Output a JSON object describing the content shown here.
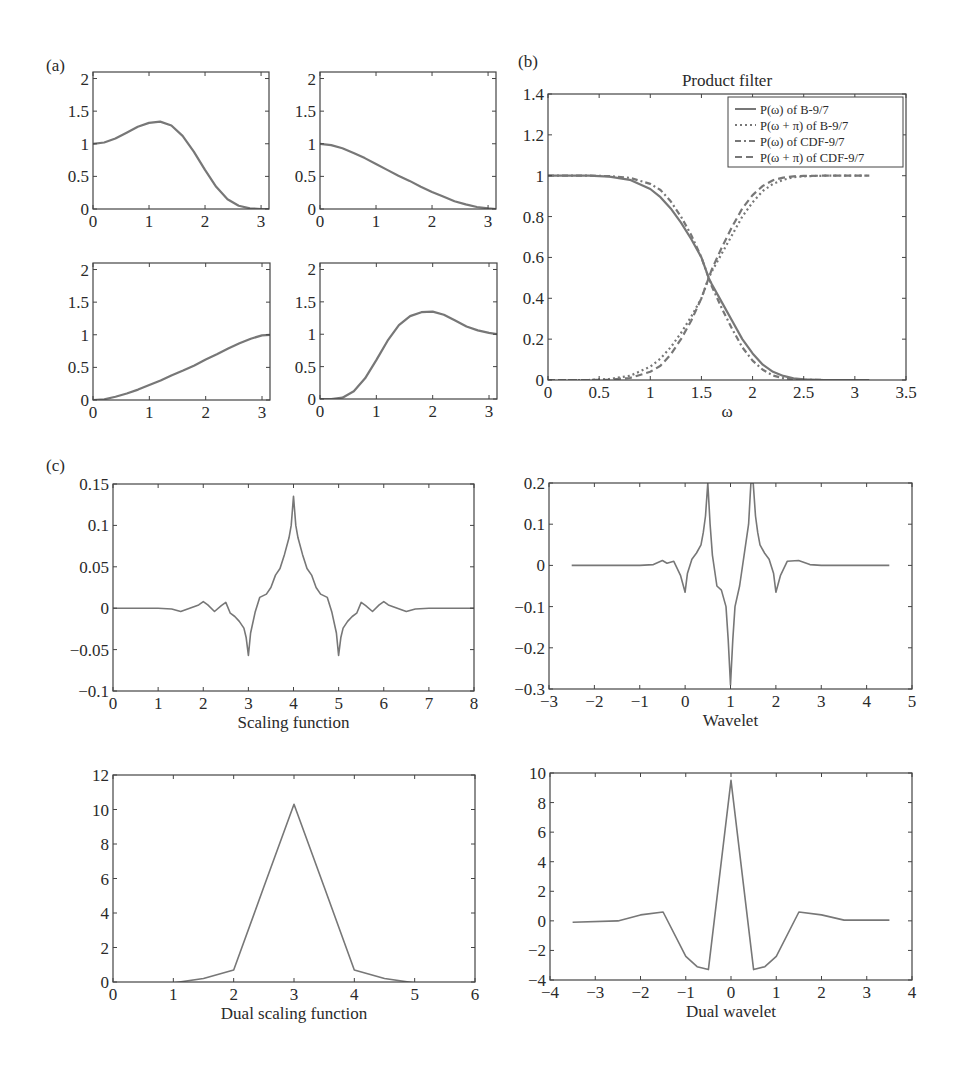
{
  "figure": {
    "panel_labels": [
      {
        "text": "(a)",
        "x": 46,
        "y": 56
      },
      {
        "text": "(b)",
        "x": 518,
        "y": 52
      },
      {
        "text": "(c)",
        "x": 46,
        "y": 456
      }
    ],
    "line_color": "#777777",
    "axis_color": "#444444"
  },
  "chart_data": [
    {
      "id": "a1",
      "type": "line",
      "panel": "(a)",
      "title": "",
      "xlabel": "",
      "ylabel": "",
      "box": [
        93,
        72,
        269,
        209
      ],
      "xlim": [
        0,
        3.1416
      ],
      "ylim": [
        0,
        2.1
      ],
      "xticks": [
        0,
        1,
        2,
        3
      ],
      "yticks": [
        0,
        0.5,
        1,
        1.5,
        2
      ],
      "xticklabels": [
        "0",
        "1",
        "2",
        "3"
      ],
      "yticklabels": [
        "0",
        "0.5",
        "1",
        "1.5",
        "2"
      ],
      "series": [
        {
          "name": "curve",
          "style": "solid",
          "x": [
            0,
            0.2,
            0.4,
            0.6,
            0.8,
            1.0,
            1.2,
            1.4,
            1.6,
            1.8,
            2.0,
            2.2,
            2.4,
            2.6,
            2.8,
            3.0,
            3.1416
          ],
          "y": [
            1.0,
            1.02,
            1.08,
            1.17,
            1.26,
            1.32,
            1.34,
            1.28,
            1.12,
            0.88,
            0.6,
            0.34,
            0.15,
            0.05,
            0.01,
            0.0,
            0.0
          ]
        }
      ]
    },
    {
      "id": "a2",
      "type": "line",
      "panel": "(a)",
      "title": "",
      "xlabel": "",
      "ylabel": "",
      "box": [
        320,
        72,
        496,
        209
      ],
      "xlim": [
        0,
        3.1416
      ],
      "ylim": [
        0,
        2.1
      ],
      "xticks": [
        0,
        1,
        2,
        3
      ],
      "yticks": [
        0,
        0.5,
        1,
        1.5,
        2
      ],
      "xticklabels": [
        "0",
        "1",
        "2",
        "3"
      ],
      "yticklabels": [
        "0",
        "0.5",
        "1",
        "1.5",
        "2"
      ],
      "series": [
        {
          "name": "curve",
          "style": "solid",
          "x": [
            0,
            0.2,
            0.4,
            0.6,
            0.8,
            1.0,
            1.2,
            1.4,
            1.6,
            1.8,
            2.0,
            2.2,
            2.4,
            2.6,
            2.8,
            3.0,
            3.1416
          ],
          "y": [
            1.0,
            0.98,
            0.93,
            0.86,
            0.78,
            0.69,
            0.6,
            0.51,
            0.43,
            0.34,
            0.26,
            0.19,
            0.12,
            0.07,
            0.03,
            0.01,
            0.0
          ]
        }
      ]
    },
    {
      "id": "a3",
      "type": "line",
      "panel": "(a)",
      "title": "",
      "xlabel": "",
      "ylabel": "",
      "box": [
        93,
        263,
        270,
        400
      ],
      "xlim": [
        0,
        3.1416
      ],
      "ylim": [
        0,
        2.1
      ],
      "xticks": [
        0,
        1,
        2,
        3
      ],
      "yticks": [
        0,
        0.5,
        1,
        1.5,
        2
      ],
      "xticklabels": [
        "0",
        "1",
        "2",
        "3"
      ],
      "yticklabels": [
        "0",
        "0.5",
        "1",
        "1.5",
        "2"
      ],
      "series": [
        {
          "name": "curve",
          "style": "solid",
          "x": [
            0,
            0.2,
            0.4,
            0.6,
            0.8,
            1.0,
            1.2,
            1.4,
            1.6,
            1.8,
            2.0,
            2.2,
            2.4,
            2.6,
            2.8,
            3.0,
            3.1416
          ],
          "y": [
            0.0,
            0.01,
            0.05,
            0.1,
            0.16,
            0.23,
            0.3,
            0.38,
            0.45,
            0.53,
            0.62,
            0.7,
            0.79,
            0.87,
            0.94,
            0.99,
            1.0
          ]
        }
      ]
    },
    {
      "id": "a4",
      "type": "line",
      "panel": "(a)",
      "title": "",
      "xlabel": "",
      "ylabel": "",
      "box": [
        320,
        263,
        497,
        399
      ],
      "xlim": [
        0,
        3.1416
      ],
      "ylim": [
        0,
        2.1
      ],
      "xticks": [
        0,
        1,
        2,
        3
      ],
      "yticks": [
        0,
        0.5,
        1,
        1.5,
        2
      ],
      "xticklabels": [
        "0",
        "1",
        "2",
        "3"
      ],
      "yticklabels": [
        "0",
        "0.5",
        "1",
        "1.5",
        "2"
      ],
      "series": [
        {
          "name": "curve",
          "style": "solid",
          "x": [
            0,
            0.2,
            0.4,
            0.6,
            0.8,
            1.0,
            1.2,
            1.4,
            1.6,
            1.8,
            2.0,
            2.2,
            2.4,
            2.6,
            2.8,
            3.0,
            3.1416
          ],
          "y": [
            0.0,
            0.0,
            0.02,
            0.12,
            0.32,
            0.6,
            0.9,
            1.14,
            1.28,
            1.34,
            1.35,
            1.3,
            1.21,
            1.12,
            1.06,
            1.02,
            1.0
          ]
        }
      ]
    },
    {
      "id": "b",
      "type": "line",
      "panel": "(b)",
      "title": "Product filter",
      "xlabel": "ω",
      "ylabel": "",
      "box": [
        548,
        94,
        906,
        380
      ],
      "xlim": [
        0,
        3.5
      ],
      "ylim": [
        0,
        1.4
      ],
      "xticks": [
        0,
        0.5,
        1,
        1.5,
        2,
        2.5,
        3,
        3.5
      ],
      "yticks": [
        0,
        0.2,
        0.4,
        0.6,
        0.8,
        1,
        1.2,
        1.4
      ],
      "xticklabels": [
        "0",
        "0.5",
        "1",
        "1.5",
        "2",
        "2.5",
        "3",
        "3.5"
      ],
      "yticklabels": [
        "0",
        "0.2",
        "0.4",
        "0.6",
        "0.8",
        "1",
        "1.2",
        "1.4"
      ],
      "legend": {
        "position": "upper right",
        "entries": [
          "P(ω) of B-9/7",
          "P(ω + π) of B-9/7",
          "P(ω) of CDF-9/7",
          "P(ω + π) of CDF-9/7"
        ]
      },
      "series": [
        {
          "name": "P(ω) of B-9/7",
          "style": "solid",
          "x": [
            0,
            0.4,
            0.6,
            0.8,
            1.0,
            1.1,
            1.2,
            1.3,
            1.4,
            1.5,
            1.571,
            1.6,
            1.7,
            1.8,
            1.9,
            2.0,
            2.1,
            2.2,
            2.3,
            2.4,
            2.5,
            2.7,
            3.1416
          ],
          "y": [
            1.0,
            1.0,
            0.995,
            0.98,
            0.935,
            0.895,
            0.84,
            0.77,
            0.69,
            0.6,
            0.5,
            0.47,
            0.38,
            0.29,
            0.2,
            0.13,
            0.075,
            0.04,
            0.02,
            0.008,
            0.003,
            0.0,
            0.0
          ]
        },
        {
          "name": "P(ω + π) of B-9/7",
          "style": "dotted",
          "x": [
            0,
            0.4,
            0.6,
            0.8,
            1.0,
            1.1,
            1.2,
            1.3,
            1.4,
            1.5,
            1.571,
            1.6,
            1.7,
            1.8,
            1.9,
            2.0,
            2.1,
            2.2,
            2.3,
            2.4,
            2.5,
            2.7,
            3.1416
          ],
          "y": [
            0.0,
            0.0,
            0.005,
            0.02,
            0.065,
            0.105,
            0.16,
            0.23,
            0.31,
            0.4,
            0.5,
            0.53,
            0.62,
            0.71,
            0.8,
            0.87,
            0.925,
            0.96,
            0.98,
            0.992,
            0.997,
            1.0,
            1.0
          ]
        },
        {
          "name": "P(ω) of CDF-9/7",
          "style": "dashdot",
          "x": [
            0,
            0.4,
            0.6,
            0.8,
            1.0,
            1.1,
            1.2,
            1.3,
            1.4,
            1.5,
            1.571,
            1.6,
            1.7,
            1.8,
            1.9,
            2.0,
            2.1,
            2.2,
            2.3,
            2.4,
            2.5,
            2.7,
            3.1416
          ],
          "y": [
            1.0,
            1.0,
            0.998,
            0.99,
            0.96,
            0.93,
            0.875,
            0.8,
            0.71,
            0.6,
            0.5,
            0.46,
            0.35,
            0.25,
            0.16,
            0.095,
            0.05,
            0.022,
            0.009,
            0.003,
            0.001,
            0.0,
            0.0
          ]
        },
        {
          "name": "P(ω + π) of CDF-9/7",
          "style": "dashed",
          "x": [
            0,
            0.4,
            0.6,
            0.8,
            1.0,
            1.1,
            1.2,
            1.3,
            1.4,
            1.5,
            1.571,
            1.6,
            1.7,
            1.8,
            1.9,
            2.0,
            2.1,
            2.2,
            2.3,
            2.4,
            2.5,
            2.7,
            3.1416
          ],
          "y": [
            0.0,
            0.0,
            0.002,
            0.01,
            0.04,
            0.07,
            0.125,
            0.2,
            0.29,
            0.4,
            0.5,
            0.54,
            0.65,
            0.75,
            0.84,
            0.905,
            0.95,
            0.978,
            0.991,
            0.997,
            0.999,
            1.0,
            1.0
          ]
        }
      ]
    },
    {
      "id": "c1",
      "type": "line",
      "panel": "(c)",
      "title": "",
      "xlabel": "Scaling function",
      "ylabel": "",
      "box": [
        113,
        484,
        474,
        691
      ],
      "xlim": [
        0,
        8
      ],
      "ylim": [
        -0.1,
        0.15
      ],
      "xticks": [
        0,
        1,
        2,
        3,
        4,
        5,
        6,
        7,
        8
      ],
      "yticks": [
        -0.1,
        -0.05,
        0,
        0.05,
        0.1,
        0.15
      ],
      "xticklabels": [
        "0",
        "1",
        "2",
        "3",
        "4",
        "5",
        "6",
        "7",
        "8"
      ],
      "yticklabels": [
        "−0.1",
        "−0.05",
        "0",
        "0.05",
        "0.1",
        "0.15"
      ],
      "series": [
        {
          "name": "scaling function",
          "style": "solid",
          "x": [
            0,
            1.0,
            1.3,
            1.5,
            1.7,
            1.9,
            2.0,
            2.1,
            2.25,
            2.4,
            2.5,
            2.6,
            2.7,
            2.8,
            2.9,
            2.95,
            3.0,
            3.05,
            3.15,
            3.25,
            3.4,
            3.5,
            3.6,
            3.7,
            3.8,
            3.9,
            3.95,
            4.0,
            4.05,
            4.1,
            4.2,
            4.3,
            4.4,
            4.5,
            4.6,
            4.75,
            4.85,
            4.95,
            5.0,
            5.05,
            5.1,
            5.2,
            5.3,
            5.4,
            5.5,
            5.6,
            5.75,
            5.9,
            6.0,
            6.1,
            6.3,
            6.5,
            6.7,
            7.0,
            8.0
          ],
          "y": [
            0,
            0,
            -0.001,
            -0.004,
            0.0,
            0.004,
            0.008,
            0.004,
            -0.004,
            0.003,
            0.007,
            -0.006,
            -0.01,
            -0.016,
            -0.024,
            -0.035,
            -0.057,
            -0.03,
            -0.005,
            0.013,
            0.017,
            0.025,
            0.04,
            0.048,
            0.065,
            0.085,
            0.1,
            0.135,
            0.1,
            0.085,
            0.065,
            0.048,
            0.04,
            0.025,
            0.017,
            0.013,
            -0.005,
            -0.03,
            -0.057,
            -0.035,
            -0.024,
            -0.016,
            -0.01,
            -0.006,
            0.007,
            0.003,
            -0.004,
            0.004,
            0.008,
            0.004,
            0.0,
            -0.004,
            -0.001,
            0,
            0
          ]
        }
      ]
    },
    {
      "id": "c2",
      "type": "line",
      "panel": "(c)",
      "title": "",
      "xlabel": "Wavelet",
      "ylabel": "",
      "box": [
        549,
        483,
        912,
        689
      ],
      "xlim": [
        -3,
        5
      ],
      "ylim": [
        -0.3,
        0.2
      ],
      "xticks": [
        -3,
        -2,
        -1,
        0,
        1,
        2,
        3,
        4,
        5
      ],
      "yticks": [
        -0.3,
        -0.2,
        -0.1,
        0,
        0.1,
        0.2
      ],
      "xticklabels": [
        "−3",
        "−2",
        "−1",
        "0",
        "1",
        "2",
        "3",
        "4",
        "5"
      ],
      "yticklabels": [
        "−0.3",
        "−0.2",
        "−0.1",
        "0",
        "0.1",
        "0.2"
      ],
      "series": [
        {
          "name": "wavelet",
          "style": "solid",
          "x": [
            -2.5,
            -1.0,
            -0.7,
            -0.5,
            -0.4,
            -0.25,
            -0.1,
            0.0,
            0.05,
            0.15,
            0.25,
            0.35,
            0.4,
            0.45,
            0.5,
            0.55,
            0.6,
            0.7,
            0.8,
            0.9,
            0.95,
            1.0,
            1.05,
            1.1,
            1.2,
            1.3,
            1.4,
            1.45,
            1.5,
            1.55,
            1.6,
            1.65,
            1.75,
            1.85,
            1.95,
            2.0,
            2.1,
            2.25,
            2.5,
            2.75,
            3.0,
            4.5
          ],
          "y": [
            0,
            0,
            0.002,
            0.012,
            0.005,
            0.01,
            -0.025,
            -0.065,
            -0.02,
            0.015,
            0.03,
            0.05,
            0.08,
            0.12,
            0.2,
            0.1,
            0.025,
            -0.05,
            -0.06,
            -0.1,
            -0.18,
            -0.29,
            -0.18,
            -0.1,
            -0.05,
            0.025,
            0.1,
            0.2,
            0.2,
            0.12,
            0.08,
            0.05,
            0.03,
            0.015,
            -0.02,
            -0.065,
            -0.025,
            0.01,
            0.012,
            0.002,
            0,
            0
          ]
        }
      ]
    },
    {
      "id": "c3",
      "type": "line",
      "panel": "(c)",
      "title": "",
      "xlabel": "Dual scaling function",
      "ylabel": "",
      "box": [
        113,
        775,
        475,
        982
      ],
      "xlim": [
        0,
        6
      ],
      "ylim": [
        0,
        12
      ],
      "xticks": [
        0,
        1,
        2,
        3,
        4,
        5,
        6
      ],
      "yticks": [
        0,
        2,
        4,
        6,
        8,
        10,
        12
      ],
      "xticklabels": [
        "0",
        "1",
        "2",
        "3",
        "4",
        "5",
        "6"
      ],
      "yticklabels": [
        "0",
        "2",
        "4",
        "6",
        "8",
        "10",
        "12"
      ],
      "series": [
        {
          "name": "dual scaling function",
          "style": "solid",
          "x": [
            0,
            1.0,
            1.5,
            2.0,
            2.5,
            3.0,
            3.5,
            4.0,
            4.5,
            5.0,
            6.0
          ],
          "y": [
            -0.1,
            -0.05,
            0.2,
            0.7,
            5.5,
            10.3,
            5.5,
            0.7,
            0.2,
            -0.05,
            -0.05
          ]
        }
      ]
    },
    {
      "id": "c4",
      "type": "line",
      "panel": "(c)",
      "title": "",
      "xlabel": "Dual wavelet",
      "ylabel": "",
      "box": [
        550,
        773,
        912,
        980
      ],
      "xlim": [
        -4,
        4
      ],
      "ylim": [
        -4,
        10
      ],
      "xticks": [
        -4,
        -3,
        -2,
        -1,
        0,
        1,
        2,
        3,
        4
      ],
      "yticks": [
        -4,
        -2,
        0,
        2,
        4,
        6,
        8,
        10
      ],
      "xticklabels": [
        "−4",
        "−3",
        "−2",
        "−1",
        "0",
        "1",
        "2",
        "3",
        "4"
      ],
      "yticklabels": [
        "−4",
        "−2",
        "0",
        "2",
        "4",
        "6",
        "8",
        "10"
      ],
      "series": [
        {
          "name": "dual wavelet",
          "style": "solid",
          "x": [
            -3.5,
            -2.5,
            -2.0,
            -1.5,
            -1.0,
            -0.75,
            -0.5,
            0.0,
            0.5,
            0.75,
            1.0,
            1.5,
            2.0,
            2.5,
            3.5
          ],
          "y": [
            -0.1,
            0.0,
            0.4,
            0.6,
            -2.4,
            -3.1,
            -3.3,
            9.5,
            -3.3,
            -3.1,
            -2.4,
            0.6,
            0.4,
            0.05,
            0.05
          ]
        }
      ]
    }
  ]
}
